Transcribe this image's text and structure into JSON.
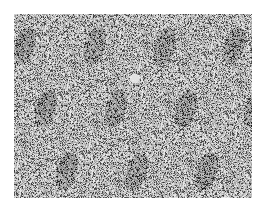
{
  "image": {
    "description": "Grayscale speckled granular texture (micrograph-like noise pattern) with darker streaks and a small bright spot near center",
    "base_color": "#b8b8b8",
    "dark_color": "#3a3a3a",
    "light_color": "#e6e6e6",
    "bounds": {
      "x": 14,
      "y": 14,
      "width": 238,
      "height": 184
    },
    "bright_spot": {
      "x": 134,
      "y": 78
    }
  }
}
